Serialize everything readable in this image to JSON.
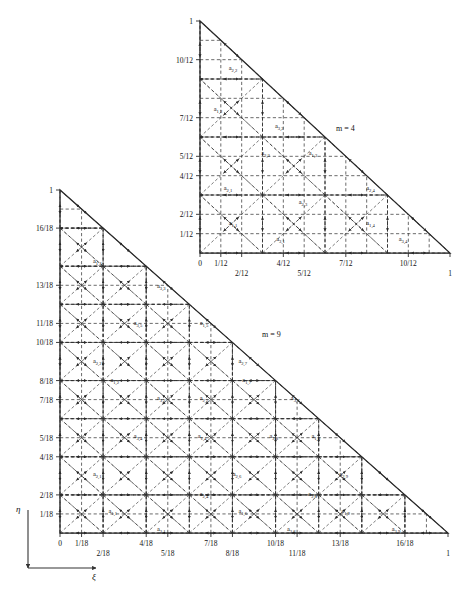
{
  "figure": {
    "axis_x_name": "ξ",
    "axis_y_name": "η",
    "line_color": "#2a2a2a",
    "dash_color": "#3a3a3a",
    "text_color": "#111111"
  },
  "chart_data": {
    "type": "diagram",
    "xlabel": "ξ",
    "ylabel": "η",
    "panels": [
      {
        "id": "upper",
        "m_label": "m = 4",
        "m_value": 4,
        "denominator": 12,
        "domain": "unit right triangle ξ≥0, η≥0, ξ+η≤1",
        "xlim": [
          0,
          1
        ],
        "ylim": [
          0,
          1
        ],
        "xticks_row1": [
          "0",
          "1/12",
          "4/12",
          "7/12",
          "10/12"
        ],
        "xticks_row1_values": [
          0,
          0.0833,
          0.3333,
          0.5833,
          0.8333
        ],
        "xticks_row2": [
          "2/12",
          "5/12",
          "1"
        ],
        "xticks_row2_values": [
          0.1667,
          0.4167,
          1.0
        ],
        "yticks": [
          "1",
          "10/12",
          "7/12",
          "5/12",
          "4/12",
          "2/12",
          "1/12"
        ],
        "ytick_values": [
          1.0,
          0.8333,
          0.5833,
          0.4167,
          0.3333,
          0.1667,
          0.0833
        ],
        "grid_fractions": [
          0,
          0.0833,
          0.1667,
          0.3333,
          0.4167,
          0.5833,
          0.6667,
          0.8333,
          0.9167
        ],
        "grid": "dashed",
        "node_labels": [
          {
            "text": "a",
            "sub": "2,2",
            "x": 0.115,
            "y": 0.795
          },
          {
            "text": "a",
            "sub": "1,2",
            "x": 0.055,
            "y": 0.615
          },
          {
            "text": "a",
            "sub": "3,2",
            "x": 0.3,
            "y": 0.545
          },
          {
            "text": "a",
            "sub": "3,3",
            "x": 0.245,
            "y": 0.425
          },
          {
            "text": "a",
            "sub": "1,3",
            "x": 0.435,
            "y": 0.425
          },
          {
            "text": "a",
            "sub": "2,1",
            "x": 0.095,
            "y": 0.275
          },
          {
            "text": "a",
            "sub": "2,3",
            "x": 0.395,
            "y": 0.215
          },
          {
            "text": "a",
            "sub": "2,4",
            "x": 0.665,
            "y": 0.275
          },
          {
            "text": "a",
            "sub": "1,1",
            "x": 0.115,
            "y": 0.125
          },
          {
            "text": "a",
            "sub": "3,1",
            "x": 0.305,
            "y": 0.055
          },
          {
            "text": "a",
            "sub": "1,4",
            "x": 0.665,
            "y": 0.125
          },
          {
            "text": "a",
            "sub": "3,4",
            "x": 0.795,
            "y": 0.055
          }
        ]
      },
      {
        "id": "lower",
        "m_label": "m = 9",
        "m_value": 9,
        "denominator": 18,
        "domain": "unit right triangle ξ≥0, η≥0, ξ+η≤1",
        "xlim": [
          0,
          1
        ],
        "ylim": [
          0,
          1
        ],
        "xticks_row1": [
          "0",
          "1/18",
          "4/18",
          "7/18",
          "10/18",
          "13/18",
          "16/18"
        ],
        "xticks_row1_values": [
          0,
          0.0556,
          0.2222,
          0.3889,
          0.5556,
          0.7222,
          0.8889
        ],
        "xticks_row2": [
          "2/18",
          "5/18",
          "8/18",
          "11/18",
          "1"
        ],
        "xticks_row2_values": [
          0.1111,
          0.2778,
          0.4444,
          0.6111,
          1.0
        ],
        "yticks": [
          "1",
          "16/18",
          "13/18",
          "11/18",
          "10/18",
          "8/18",
          "7/18",
          "5/18",
          "4/18",
          "2/18",
          "1/18"
        ],
        "ytick_values": [
          1.0,
          0.8889,
          0.7222,
          0.6111,
          0.5556,
          0.4444,
          0.3889,
          0.2778,
          0.2222,
          0.1111,
          0.0556
        ],
        "grid_fractions": [
          0,
          0.0556,
          0.1111,
          0.2222,
          0.2778,
          0.3889,
          0.4444,
          0.5556,
          0.6111,
          0.7222,
          0.7778,
          0.8889,
          0.9444
        ],
        "grid": "dashed",
        "node_labels": [
          {
            "text": "a",
            "sub": "1,3",
            "x": 0.085,
            "y": 0.79
          },
          {
            "text": "a",
            "sub": "3,3",
            "x": 0.25,
            "y": 0.718
          },
          {
            "text": "a",
            "sub": "3,5",
            "x": 0.19,
            "y": 0.61
          },
          {
            "text": "a",
            "sub": "1,5",
            "x": 0.36,
            "y": 0.61
          },
          {
            "text": "a",
            "sub": "2,2",
            "x": 0.085,
            "y": 0.5
          },
          {
            "text": "a",
            "sub": "2,7",
            "x": 0.46,
            "y": 0.5
          },
          {
            "text": "a",
            "sub": "1,2",
            "x": 0.13,
            "y": 0.443
          },
          {
            "text": "a",
            "sub": "3,2",
            "x": 0.25,
            "y": 0.39
          },
          {
            "text": "a",
            "sub": "2,5",
            "x": 0.36,
            "y": 0.39
          },
          {
            "text": "a",
            "sub": "1,7",
            "x": 0.47,
            "y": 0.443
          },
          {
            "text": "a",
            "sub": "3,7",
            "x": 0.595,
            "y": 0.39
          },
          {
            "text": "a",
            "sub": "3,4",
            "x": 0.19,
            "y": 0.28
          },
          {
            "text": "a",
            "sub": "1,4",
            "x": 0.355,
            "y": 0.28
          },
          {
            "text": "a",
            "sub": "3,8",
            "x": 0.54,
            "y": 0.28
          },
          {
            "text": "a",
            "sub": "1,8",
            "x": 0.648,
            "y": 0.28
          },
          {
            "text": "a",
            "sub": "2,1",
            "x": 0.085,
            "y": 0.17
          },
          {
            "text": "a",
            "sub": "2,6",
            "x": 0.445,
            "y": 0.17
          },
          {
            "text": "a",
            "sub": "2,9",
            "x": 0.72,
            "y": 0.17
          },
          {
            "text": "a",
            "sub": "2,4",
            "x": 0.36,
            "y": 0.112
          },
          {
            "text": "a",
            "sub": "2,8",
            "x": 0.64,
            "y": 0.112
          },
          {
            "text": "a",
            "sub": "1,1",
            "x": 0.125,
            "y": 0.06
          },
          {
            "text": "a",
            "sub": "1,6",
            "x": 0.46,
            "y": 0.06
          },
          {
            "text": "a",
            "sub": "1,9",
            "x": 0.725,
            "y": 0.06
          },
          {
            "text": "a",
            "sub": "3,1",
            "x": 0.25,
            "y": 0.008
          },
          {
            "text": "a",
            "sub": "3,6",
            "x": 0.585,
            "y": 0.008
          },
          {
            "text": "a",
            "sub": "3,9",
            "x": 0.855,
            "y": 0.008
          }
        ]
      }
    ]
  }
}
